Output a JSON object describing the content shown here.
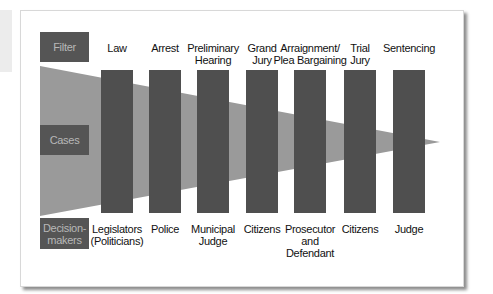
{
  "colors": {
    "band": "#9a9a9a",
    "bar": "#4f4f4f",
    "header_bg": "#555555",
    "header_text": "#b8b8b8"
  },
  "row_headers": {
    "filter": "Filter",
    "cases": "Cases",
    "decision_makers_line1": "Decision-",
    "decision_makers_line2": "makers"
  },
  "stages": [
    {
      "filter": [
        "Law"
      ],
      "decision_maker": [
        "Legislators",
        "(Politicians)"
      ]
    },
    {
      "filter": [
        "Arrest"
      ],
      "decision_maker": [
        "Police"
      ]
    },
    {
      "filter": [
        "Preliminary",
        "Hearing"
      ],
      "decision_maker": [
        "Municipal",
        "Judge"
      ]
    },
    {
      "filter": [
        "Grand",
        "Jury"
      ],
      "decision_maker": [
        "Citizens"
      ]
    },
    {
      "filter": [
        "Arraignment/",
        "Plea Bargaining"
      ],
      "decision_maker": [
        "Prosecutor",
        "and",
        "Defendant"
      ]
    },
    {
      "filter": [
        "Trial",
        "Jury"
      ],
      "decision_maker": [
        "Citizens"
      ]
    },
    {
      "filter": [
        "Sentencing"
      ],
      "decision_maker": [
        "Judge"
      ]
    }
  ]
}
